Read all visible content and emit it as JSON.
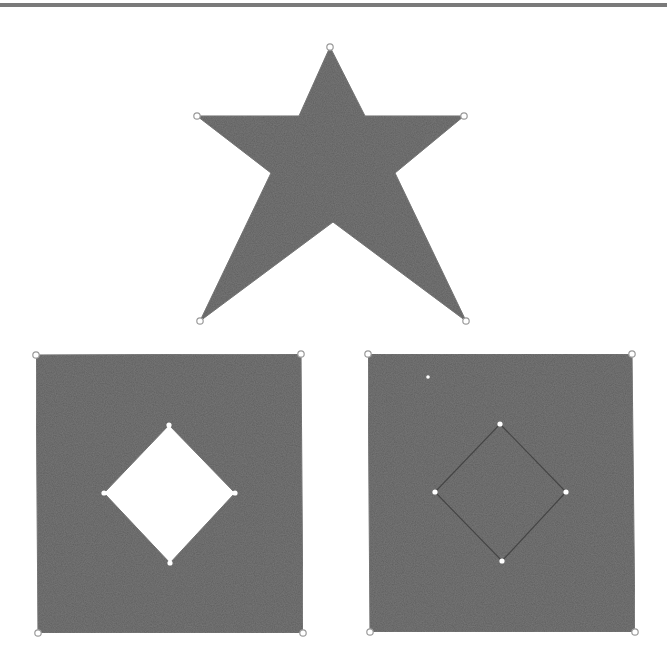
{
  "colors": {
    "fill": "#5e5e5e",
    "background": "#ffffff",
    "handle_stroke": "#9a9a9a",
    "handle_fill": "#ffffff",
    "inner_edge": "#444444",
    "rule": "#7a7a7a"
  },
  "figures": [
    {
      "id": "star",
      "description": "Self-intersecting five-pointed star polygon",
      "outer_vertices": [
        [
          330,
          47
        ],
        [
          464,
          116
        ],
        [
          466,
          321
        ],
        [
          200,
          321
        ],
        [
          197,
          116
        ]
      ],
      "outline": [
        [
          330,
          47
        ],
        [
          365,
          116
        ],
        [
          464,
          116
        ],
        [
          395,
          173
        ],
        [
          466,
          321
        ],
        [
          333,
          222
        ],
        [
          200,
          321
        ],
        [
          271,
          173
        ],
        [
          197,
          116
        ],
        [
          299,
          116
        ]
      ]
    },
    {
      "id": "square-with-hole",
      "description": "Square with diamond-shaped hole (even-odd fill)",
      "outer_vertices": [
        [
          36,
          355
        ],
        [
          301,
          354
        ],
        [
          303,
          633
        ],
        [
          38,
          633
        ]
      ],
      "hole_vertices": [
        [
          169,
          425
        ],
        [
          235,
          493
        ],
        [
          170,
          563
        ],
        [
          104,
          493
        ]
      ],
      "hole_filled": false
    },
    {
      "id": "square-with-filled-diamond",
      "description": "Square with inner diamond contour filled (nonzero fill)",
      "outer_vertices": [
        [
          368,
          354
        ],
        [
          632,
          354
        ],
        [
          635,
          632
        ],
        [
          370,
          632
        ]
      ],
      "hole_vertices": [
        [
          500,
          424
        ],
        [
          566,
          492
        ],
        [
          502,
          561
        ],
        [
          435,
          492
        ]
      ],
      "hole_filled": true,
      "extra_dot": [
        428,
        377
      ]
    }
  ]
}
